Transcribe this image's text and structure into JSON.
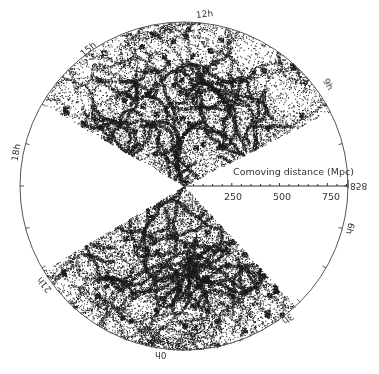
{
  "chart_data": {
    "type": "scatter",
    "title": "",
    "subtitle": "Galaxy redshift survey cone diagram (two wedges, polar projection)",
    "axis_title": "Comoving distance (Mpc)",
    "radial_ticks": [
      {
        "value": 250,
        "label": "250"
      },
      {
        "value": 500,
        "label": "500"
      },
      {
        "value": 750,
        "label": "750"
      }
    ],
    "radial_max": 858,
    "radial_max_label": "858",
    "angular_labels": [
      {
        "label": "12h",
        "angle_deg": 80
      },
      {
        "label": "9h",
        "angle_deg": 36
      },
      {
        "label": "6h",
        "angle_deg": -14
      },
      {
        "label": "3h",
        "angle_deg": -52
      },
      {
        "label": "0h",
        "angle_deg": -100
      },
      {
        "label": "21h",
        "angle_deg": -143
      },
      {
        "label": "18h",
        "angle_deg": 167
      },
      {
        "label": "15h",
        "angle_deg": 128
      }
    ],
    "wedges": [
      {
        "name": "north",
        "angle_start_deg": 27,
        "angle_end_deg": 150,
        "density": "high"
      },
      {
        "name": "south",
        "angle_start_deg": 211,
        "angle_end_deg": 313,
        "density": "high"
      }
    ],
    "grid": false,
    "legend": null
  },
  "labels": {
    "axis_title": "Comoving distance (Mpc)",
    "tick_250": "250",
    "tick_500": "500",
    "tick_750": "750",
    "max_label": "858",
    "ra_12": "12h",
    "ra_15": "15h",
    "ra_18": "18h",
    "ra_21": "21h",
    "ra_0": "0h",
    "ra_3": "3h",
    "ra_6": "6h",
    "ra_9": "9h"
  },
  "colors": {
    "points": "#1a1a1a",
    "circle": "#555555",
    "background": "#ffffff"
  }
}
